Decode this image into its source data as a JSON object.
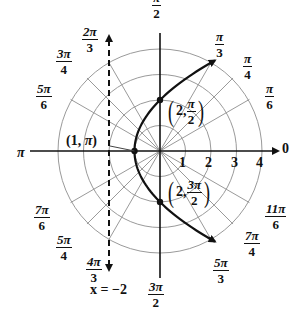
{
  "figure": {
    "origin_px": [
      160,
      151
    ],
    "unit_px": 25.5,
    "colors": {
      "grid": "#9a9a9a",
      "axis": "#111111",
      "curve": "#111111",
      "directrix": "#111111"
    }
  },
  "rings": {
    "radii": [
      1,
      2,
      3,
      4
    ],
    "labels": [
      "1",
      "2",
      "3",
      "4"
    ]
  },
  "radial_lines_deg": [
    0,
    30,
    45,
    60,
    90,
    120,
    135,
    150,
    180,
    210,
    225,
    240,
    270,
    300,
    315,
    330
  ],
  "angle_labels": [
    {
      "key": "zero",
      "num": "0",
      "den": ""
    },
    {
      "key": "pi6",
      "num": "π",
      "den": "6"
    },
    {
      "key": "pi4",
      "num": "π",
      "den": "4"
    },
    {
      "key": "pi3",
      "num": "π",
      "den": "3"
    },
    {
      "key": "pi2",
      "num": "π",
      "den": "2"
    },
    {
      "key": "2pi3",
      "num": "2π",
      "den": "3"
    },
    {
      "key": "3pi4",
      "num": "3π",
      "den": "4"
    },
    {
      "key": "5pi6",
      "num": "5π",
      "den": "6"
    },
    {
      "key": "pi",
      "num": "π",
      "den": ""
    },
    {
      "key": "7pi6",
      "num": "7π",
      "den": "6"
    },
    {
      "key": "5pi4",
      "num": "5π",
      "den": "4"
    },
    {
      "key": "4pi3",
      "num": "4π",
      "den": "3"
    },
    {
      "key": "3pi2",
      "num": "3π",
      "den": "2"
    },
    {
      "key": "5pi3",
      "num": "5π",
      "den": "3"
    },
    {
      "key": "7pi4",
      "num": "7π",
      "den": "4"
    },
    {
      "key": "11pi6",
      "num": "11π",
      "den": "6"
    }
  ],
  "curve": {
    "name": "parabola",
    "equation_polar": "r = 2 / (1 - cos θ)",
    "focus": [
      0,
      0
    ],
    "vertex": [
      -1,
      0
    ],
    "arrows_at_ends": true
  },
  "directrix": {
    "equation": "x = −2",
    "x": -2,
    "style": "dashed",
    "arrows_at_ends": true
  },
  "points": [
    {
      "label_prefix": "(1, ",
      "label_pi": "π",
      "label_suffix": ")",
      "polar": [
        1,
        180
      ],
      "name": "vertex-point"
    },
    {
      "label_prefix": "2, ",
      "num": "π",
      "den": "2",
      "polar": [
        2,
        90
      ],
      "name": "point-2-pi-over-2"
    },
    {
      "label_prefix": "2, ",
      "num": "3π",
      "den": "2",
      "polar": [
        2,
        270
      ],
      "name": "point-2-3pi-over-2"
    }
  ]
}
